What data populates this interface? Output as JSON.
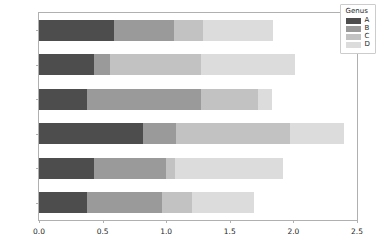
{
  "chart_data": {
    "type": "bar",
    "orientation": "horizontal",
    "stacked": true,
    "title": "",
    "xlabel": "",
    "ylabel": "",
    "xlim": [
      0.0,
      2.5
    ],
    "xticks": [
      "0.0",
      "0.5",
      "1.0",
      "1.5",
      "2.0",
      "2.5"
    ],
    "xtick_values": [
      0.0,
      0.5,
      1.0,
      1.5,
      2.0,
      2.5
    ],
    "grid": false,
    "legend_title": "Genus",
    "legend_position": "upper right",
    "categories": [
      "one",
      "two",
      "three",
      "four",
      "five",
      "six"
    ],
    "categories_top_to_bottom": [
      "six",
      "five",
      "four",
      "three",
      "two",
      "one"
    ],
    "series": [
      {
        "name": "A",
        "color": "#4d4d4d",
        "values": [
          0.38,
          0.43,
          0.82,
          0.38,
          0.43,
          0.59
        ]
      },
      {
        "name": "B",
        "color": "#9a9a9a",
        "values": [
          0.59,
          0.57,
          0.26,
          0.89,
          0.13,
          0.47
        ]
      },
      {
        "name": "C",
        "color": "#c2c2c2",
        "values": [
          0.23,
          0.07,
          0.89,
          0.45,
          0.71,
          0.23
        ]
      },
      {
        "name": "D",
        "color": "#dcdcdc",
        "values": [
          0.49,
          0.85,
          0.43,
          0.11,
          0.74,
          0.55
        ]
      }
    ],
    "totals": [
      1.69,
      1.92,
      2.4,
      1.83,
      2.01,
      1.84
    ]
  },
  "legend": {
    "title": "Genus",
    "entries": [
      {
        "label": "A",
        "color": "#4d4d4d"
      },
      {
        "label": "B",
        "color": "#9a9a9a"
      },
      {
        "label": "C",
        "color": "#c2c2c2"
      },
      {
        "label": "D",
        "color": "#dcdcdc"
      }
    ]
  },
  "axes": {
    "spine_color": "#b0b0b0",
    "background": "#ffffff",
    "tick_label_color": "#262626"
  }
}
